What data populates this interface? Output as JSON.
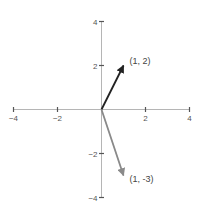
{
  "diagram": {
    "type": "vector-plot",
    "origin_px": [
      101.5,
      109.5
    ],
    "scale_px_per_unit": 22,
    "x_ticks": [
      {
        "value": -4,
        "label": "-4"
      },
      {
        "value": -2,
        "label": "-2"
      },
      {
        "value": 2,
        "label": "2"
      },
      {
        "value": 4,
        "label": "4"
      }
    ],
    "y_ticks": [
      {
        "value": 4,
        "label": "4"
      },
      {
        "value": 2,
        "label": "2"
      },
      {
        "value": -2,
        "label": "-2"
      },
      {
        "value": -4,
        "label": "-4"
      }
    ],
    "vectors": [
      {
        "x": 1,
        "y": 2,
        "label": "(1, 2)",
        "color": "#222222"
      },
      {
        "x": 1,
        "y": -3,
        "label": "(1, -3)",
        "color": "#8a8a8a"
      }
    ],
    "axis_color": "#b5b5b5",
    "tick_color": "#555555"
  }
}
